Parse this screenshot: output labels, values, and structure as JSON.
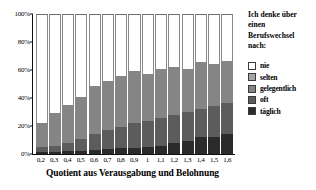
{
  "chart_data": {
    "type": "bar",
    "stacked": true,
    "title": "",
    "xlabel": "Quotient aus Verausgabung und Belohnung",
    "ylabel": "",
    "ylim": [
      0,
      100
    ],
    "yticks": [
      "0%",
      "20%",
      "40%",
      "60%",
      "80%",
      "100%"
    ],
    "ytick_values": [
      0,
      20,
      40,
      60,
      80,
      100
    ],
    "grid": false,
    "legend_position": "right",
    "legend_title": "Ich denke über einen Berufswechsel nach:",
    "categories": [
      "0,2",
      "0,3",
      "0,4",
      "0,5",
      "0,6",
      "0,7",
      "0,8",
      "0,9",
      "1",
      "1,1",
      "1,2",
      "1,3",
      "1,4",
      "1,5",
      "1,6"
    ],
    "series": [
      {
        "name": "täglich",
        "color": "#2b2b2b",
        "values": [
          1.5,
          1.5,
          2.0,
          2.5,
          3.0,
          3.5,
          4.0,
          4.5,
          5.0,
          6.0,
          8.0,
          9.0,
          12.0,
          12.5,
          14.0
        ]
      },
      {
        "name": "oft",
        "color": "#5c5c5c",
        "values": [
          3.5,
          4.0,
          6.0,
          8.5,
          11.0,
          13.5,
          15.0,
          17.5,
          18.5,
          19.5,
          20.0,
          21.0,
          20.0,
          22.0,
          22.5
        ]
      },
      {
        "name": "gelegentlich",
        "color": "#858585",
        "values": [
          17.0,
          23.5,
          27.0,
          30.0,
          34.5,
          35.5,
          37.0,
          37.0,
          34.0,
          35.0,
          34.5,
          31.0,
          34.0,
          30.0,
          30.0
        ]
      },
      {
        "name": "selten",
        "color": "#a6a6a6",
        "values": [
          0.0,
          0.0,
          0.0,
          0.0,
          0.0,
          0.0,
          0.0,
          0.0,
          0.0,
          0.0,
          0.0,
          0.0,
          0.0,
          0.0,
          0.0
        ]
      },
      {
        "name": "nie",
        "color": "#ffffff",
        "values": [
          78.0,
          71.0,
          65.0,
          59.0,
          51.5,
          47.5,
          44.0,
          41.0,
          42.5,
          39.5,
          37.5,
          39.0,
          34.0,
          35.5,
          33.5
        ]
      }
    ],
    "bar_totals_visible": [
      22.0,
      29.0,
      35.0,
      41.0,
      48.5,
      52.5,
      56.0,
      59.0,
      57.5,
      60.5,
      62.5,
      61.0,
      66.0,
      64.5,
      66.5
    ],
    "legend_entries": [
      {
        "label": "nie",
        "color": "#ffffff"
      },
      {
        "label": "selten",
        "color": "#a6a6a6"
      },
      {
        "label": "gelegentlich",
        "color": "#858585"
      },
      {
        "label": "oft",
        "color": "#5c5c5c"
      },
      {
        "label": "täglich",
        "color": "#2b2b2b"
      }
    ]
  },
  "legend": {
    "title_lines": [
      "Ich denke über",
      "einen",
      "Berufswechsel",
      "nach:"
    ]
  }
}
